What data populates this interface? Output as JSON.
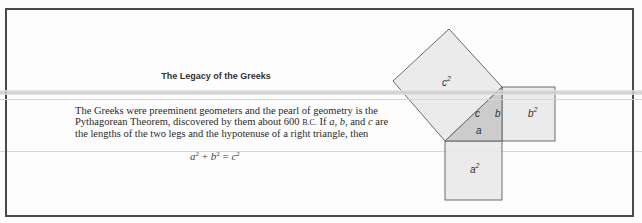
{
  "document": {
    "title": "The Legacy of the Greeks",
    "paragraph_lines": [
      [
        "The Greeks were preeminent geometers and the pearl of geometry is the"
      ],
      [
        "Pythagorean Theorem, discovered by them about 600 ",
        "B.C.",
        " If ",
        "a",
        ", ",
        "b",
        ", and ",
        "c",
        " are"
      ],
      [
        "the lengths of the two legs and the hypotenuse of a right triangle, then"
      ]
    ],
    "equation": {
      "a": "a",
      "b": "b",
      "c": "c",
      "exp": "2",
      "plus": " + ",
      "equals": " = "
    }
  },
  "diagram": {
    "labels": {
      "c_square": "c",
      "b_square": "b",
      "a_square": "a",
      "exp": "2",
      "side_c": "c",
      "side_b": "b",
      "side_a": "a"
    },
    "colors": {
      "square_fill": "#e9e9e9",
      "triangle_fill": "#c6c6c6",
      "stroke": "#6a6a6a"
    }
  }
}
